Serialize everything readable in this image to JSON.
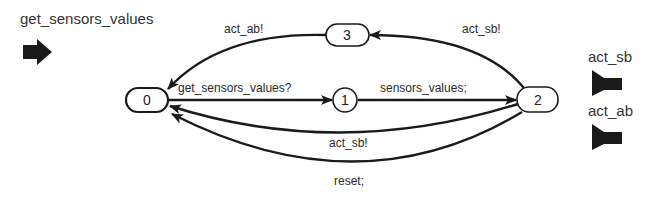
{
  "diagram": {
    "type": "state-machine",
    "input_ports": [
      {
        "label": "get_sensors_values",
        "icon": "input-arrow-icon"
      }
    ],
    "output_ports": [
      {
        "label": "act_sb",
        "icon": "output-port-icon"
      },
      {
        "label": "act_ab",
        "icon": "output-port-icon"
      }
    ],
    "states": [
      {
        "id": "0",
        "label": "0",
        "initial": true
      },
      {
        "id": "1",
        "label": "1"
      },
      {
        "id": "2",
        "label": "2"
      },
      {
        "id": "3",
        "label": "3"
      }
    ],
    "transitions": [
      {
        "from": "0",
        "to": "1",
        "label": "get_sensors_values?"
      },
      {
        "from": "1",
        "to": "2",
        "label": "sensors_values;"
      },
      {
        "from": "2",
        "to": "3",
        "label": "act_sb!"
      },
      {
        "from": "3",
        "to": "0",
        "label": "act_ab!"
      },
      {
        "from": "2",
        "to": "0",
        "label": "act_sb!"
      },
      {
        "from": "2",
        "to": "0",
        "label": "reset;"
      }
    ],
    "colors": {
      "stroke": "#1a1a1a",
      "background": "#ffffff",
      "text": "#2a2a2a"
    }
  }
}
